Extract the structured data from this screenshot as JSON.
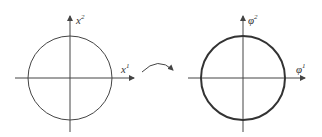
{
  "diagram": {
    "left": {
      "x_axis_label": "x",
      "x_axis_sup": "1",
      "y_axis_label": "x",
      "y_axis_sup": "2",
      "shape": "circle"
    },
    "right": {
      "x_axis_label": "φ",
      "x_axis_sup": "1",
      "y_axis_label": "φ",
      "y_axis_sup": "2",
      "shape": "circle"
    },
    "mapping_arrow": "curved-arrow",
    "colors": {
      "stroke": "#333333",
      "background": "#ffffff"
    }
  }
}
